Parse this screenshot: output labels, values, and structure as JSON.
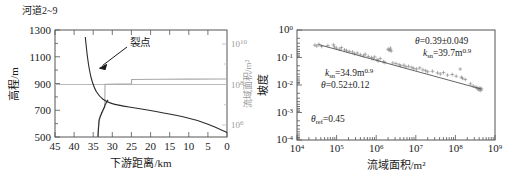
{
  "figure": {
    "panels": [
      {
        "id": "longitudinal-profile",
        "title": "河道22~9",
        "title_text": "河道2~9",
        "annotation": "裂点",
        "axes": {
          "y_left": {
            "label": "高程/m",
            "ticks": [
              "1300",
              "1100",
              "900",
              "700",
              "500"
            ],
            "min": 500,
            "max": 1300
          },
          "x": {
            "label": "下游距离/km",
            "ticks": [
              "45",
              "40",
              "35",
              "30",
              "25",
              "20",
              "15",
              "10",
              "5",
              "0"
            ],
            "min": 0,
            "max": 45,
            "reversed": true
          },
          "y_right": {
            "label": "流域面积/m²",
            "ticks": [
              "10",
              "10",
              "10"
            ],
            "tick_exponents": [
              "10",
              "8",
              "6"
            ],
            "color": "#9a9a9a",
            "scale": "log"
          }
        }
      },
      {
        "id": "slope-area-plot",
        "axes": {
          "y": {
            "label": "坡度",
            "ticks": [
              "10",
              "10",
              "10",
              "10",
              "10"
            ],
            "tick_exponents": [
              "0",
              "-1",
              "-2",
              "-3",
              "-4"
            ],
            "scale": "log"
          },
          "x": {
            "label": "流域面积/m²",
            "ticks": [
              "10",
              "10",
              "10",
              "10",
              "10",
              "10"
            ],
            "tick_exponents": [
              "4",
              "5",
              "6",
              "7",
              "8",
              "9"
            ],
            "scale": "log"
          }
        },
        "annotations": [
          {
            "id": "upper-right-theta",
            "symbol": "θ",
            "text": "=0.39±0.049"
          },
          {
            "id": "upper-right-ksn",
            "symbol": "k",
            "subscript": "sn",
            "text": "=39.7m",
            "superscript": "0.9"
          },
          {
            "id": "mid-left-ksn",
            "symbol": "k",
            "subscript": "sn",
            "text": "=34.9m",
            "superscript": "0.9"
          },
          {
            "id": "mid-left-theta",
            "symbol": "θ",
            "text": "=0.52±0.12"
          },
          {
            "id": "lower-left-theta-ref",
            "symbol": "θ",
            "subscript": "ref",
            "text": "=0.45"
          }
        ]
      }
    ]
  },
  "chart_data": [
    {
      "type": "line",
      "title": "河道2~9",
      "xlabel": "下游距离/km",
      "ylabel": "高程/m",
      "y2label": "流域面积/m²",
      "xlim": [
        45,
        0
      ],
      "ylim": [
        500,
        1300
      ],
      "y2lim_log10": [
        5.3,
        10.6
      ],
      "grid": false,
      "legend": null,
      "annotations": [
        {
          "text": "裂点",
          "points_to_x": 40.0,
          "points_to_y": 1010
        }
      ],
      "series": [
        {
          "name": "河道纵剖面 (高程)",
          "axis": "y_left",
          "color": "#2a2a2a",
          "x": [
            40.3,
            40.2,
            40.1,
            40.0,
            39.8,
            39.6,
            39.3,
            39.0,
            38.6,
            38.2,
            37.7,
            37.2,
            36.6,
            36.0,
            35.4,
            34.6,
            33.5,
            32.0,
            30.0,
            27.5,
            25.0,
            22.0,
            19.0,
            16.0,
            13.0,
            10.0,
            7.0,
            4.0,
            1.5,
            0.0
          ],
          "y": [
            1245,
            1210,
            1165,
            1120,
            1080,
            1045,
            1012,
            985,
            960,
            938,
            918,
            898,
            878,
            860,
            845,
            830,
            818,
            808,
            795,
            782,
            768,
            752,
            735,
            718,
            700,
            682,
            662,
            638,
            608,
            580
          ]
        },
        {
          "name": "河道纵剖面 (流域面积)",
          "axis": "y_right",
          "color": "#a8a8a8",
          "x": [
            41.0,
            40.6,
            40.2,
            39.8,
            39.4,
            39.0,
            38.5,
            38.0,
            37.4,
            36.9,
            36.4,
            36.0,
            35.9,
            35.6,
            30.0,
            25.2,
            25.0,
            18.0,
            10.0,
            3.0,
            0.0
          ],
          "y_log10": [
            5.35,
            5.9,
            6.25,
            6.45,
            6.55,
            6.62,
            6.72,
            6.85,
            6.95,
            7.05,
            7.15,
            7.2,
            8.55,
            8.56,
            8.58,
            8.6,
            8.82,
            8.84,
            8.86,
            8.88,
            8.9
          ]
        }
      ]
    },
    {
      "type": "scatter",
      "xlabel": "流域面积/m²",
      "ylabel": "坡度",
      "xlim_log10": [
        4,
        9
      ],
      "ylim_log10": [
        -4,
        0
      ],
      "xscale": "log",
      "yscale": "log",
      "grid": false,
      "marker": "+",
      "marker_color": "#8e8e8e",
      "fit_line": {
        "x_log10": [
          4.55,
          8.65
        ],
        "y_log10": [
          -0.53,
          -2.15
        ],
        "color": "#555555"
      },
      "annotations": [
        {
          "text": "θ=0.39±0.049",
          "x_log10": 7.0,
          "y_log10": -0.52
        },
        {
          "text": "k_sn=39.7m^0.9",
          "x_log10": 7.0,
          "y_log10": -0.82
        },
        {
          "text": "k_sn=34.9m^0.9",
          "x_log10": 5.25,
          "y_log10": -1.38
        },
        {
          "text": "θ=0.52±0.12",
          "x_log10": 5.25,
          "y_log10": -1.62
        },
        {
          "text": "θ_ref=0.45",
          "x_log10": 5.0,
          "y_log10": -3.25
        }
      ],
      "points_log10": [
        [
          4.45,
          -0.55
        ],
        [
          4.5,
          -0.58
        ],
        [
          4.55,
          -0.52
        ],
        [
          4.62,
          -0.6
        ],
        [
          4.78,
          -0.57
        ],
        [
          4.92,
          -0.54
        ],
        [
          4.95,
          -0.62
        ],
        [
          5.0,
          -0.66
        ],
        [
          5.08,
          -0.7
        ],
        [
          5.12,
          -0.64
        ],
        [
          5.2,
          -0.72
        ],
        [
          5.25,
          -0.75
        ],
        [
          5.32,
          -0.78
        ],
        [
          5.4,
          -0.8
        ],
        [
          5.45,
          -0.86
        ],
        [
          5.52,
          -0.84
        ],
        [
          5.6,
          -0.9
        ],
        [
          5.68,
          -0.94
        ],
        [
          5.72,
          -0.88
        ],
        [
          5.8,
          -0.96
        ],
        [
          5.88,
          -1.0
        ],
        [
          5.92,
          -1.05
        ],
        [
          5.96,
          -0.98
        ],
        [
          6.02,
          -1.08
        ],
        [
          6.05,
          -1.12
        ],
        [
          6.1,
          -1.04
        ],
        [
          6.18,
          -1.15
        ],
        [
          6.22,
          -1.18
        ],
        [
          6.3,
          -0.7
        ],
        [
          6.32,
          -0.72
        ],
        [
          6.35,
          -0.74
        ],
        [
          6.38,
          -0.76
        ],
        [
          6.36,
          -0.66
        ],
        [
          6.42,
          -1.2
        ],
        [
          6.5,
          -1.22
        ],
        [
          6.58,
          -1.26
        ],
        [
          6.62,
          -1.3
        ],
        [
          6.7,
          -1.28
        ],
        [
          6.75,
          -1.34
        ],
        [
          6.82,
          -1.32
        ],
        [
          6.9,
          -1.36
        ],
        [
          6.95,
          -1.4
        ],
        [
          7.02,
          -1.42
        ],
        [
          7.1,
          -1.38
        ],
        [
          7.18,
          -1.45
        ],
        [
          7.25,
          -1.48
        ],
        [
          7.3,
          -1.52
        ],
        [
          7.42,
          -1.5
        ],
        [
          7.55,
          -1.56
        ],
        [
          7.62,
          -1.6
        ],
        [
          7.7,
          -1.55
        ],
        [
          7.8,
          -1.64
        ],
        [
          7.92,
          -1.62
        ],
        [
          8.02,
          -1.68
        ],
        [
          8.12,
          -1.42
        ],
        [
          8.15,
          -1.72
        ],
        [
          8.18,
          -1.76
        ],
        [
          8.25,
          -1.8
        ],
        [
          8.38,
          -1.96
        ],
        [
          8.45,
          -2.04
        ],
        [
          8.52,
          -2.08
        ],
        [
          8.55,
          -2.12
        ],
        [
          8.58,
          -2.15
        ],
        [
          8.6,
          -2.18
        ],
        [
          8.62,
          -2.1
        ],
        [
          8.64,
          -2.2
        ],
        [
          8.66,
          -2.14
        ]
      ]
    }
  ]
}
